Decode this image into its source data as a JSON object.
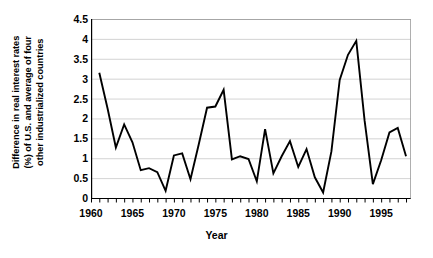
{
  "chart_data": {
    "type": "line",
    "title": "",
    "xlabel": "Year",
    "ylabel_lines": [
      "Difference in real interest rates",
      "(%) of U.S. and average of four",
      "other industrialized countries"
    ],
    "ylabel": "Difference in real interest rates (%) of U.S. and average of four other industrialized countries",
    "xlim": [
      1960,
      1998.6
    ],
    "ylim": [
      0,
      4.5
    ],
    "ytick_labels": [
      "0",
      "0.5",
      "1",
      "1.5",
      "2",
      "2.5",
      "3",
      "3.5",
      "4",
      "4.5"
    ],
    "ytick_values": [
      0,
      0.5,
      1,
      1.5,
      2,
      2.5,
      3,
      3.5,
      4,
      4.5
    ],
    "xtick_labels": [
      "1960",
      "1965",
      "1970",
      "1975",
      "1980",
      "1985",
      "1990",
      "1995"
    ],
    "xtick_values": [
      1960,
      1965,
      1970,
      1975,
      1980,
      1985,
      1990,
      1995
    ],
    "xtick_minor_step": 1,
    "grid": "horizontal",
    "legend": null,
    "series": [
      {
        "name": "Difference in real interest rates",
        "color": "#000000",
        "x": [
          1961,
          1962,
          1963,
          1964,
          1965,
          1966,
          1967,
          1968,
          1969,
          1970,
          1971,
          1972,
          1973,
          1974,
          1975,
          1976,
          1977,
          1978,
          1979,
          1980,
          1981,
          1982,
          1983,
          1984,
          1985,
          1986,
          1987,
          1988,
          1989,
          1990,
          1991,
          1992,
          1993,
          1994,
          1995,
          1996,
          1997,
          1998
        ],
        "values": [
          3.15,
          2.25,
          1.27,
          1.85,
          1.4,
          0.7,
          0.75,
          0.65,
          0.18,
          1.07,
          1.12,
          0.47,
          1.35,
          2.27,
          2.3,
          2.72,
          0.97,
          1.05,
          0.98,
          0.42,
          1.73,
          0.62,
          1.05,
          1.43,
          0.78,
          1.23,
          0.52,
          0.14,
          1.17,
          2.97,
          3.6,
          3.95,
          1.95,
          0.35,
          0.95,
          1.65,
          1.76,
          1.05
        ]
      }
    ]
  }
}
